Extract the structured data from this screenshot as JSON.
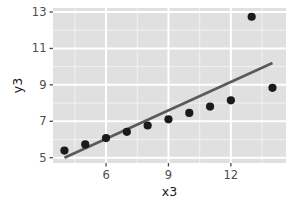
{
  "chart_data": {
    "type": "scatter",
    "title": "",
    "xlabel": "x3",
    "ylabel": "y3",
    "x": [
      4,
      5,
      6,
      7,
      8,
      9,
      10,
      11,
      12,
      13,
      14
    ],
    "y": [
      5.39,
      5.73,
      6.08,
      6.42,
      6.77,
      7.11,
      7.46,
      7.81,
      8.15,
      12.74,
      8.84
    ],
    "xlim": [
      3.45,
      14.65
    ],
    "ylim": [
      4.71,
      13.22
    ],
    "xticks": [
      6,
      9,
      12
    ],
    "xtick_labels": [
      "6",
      "9",
      "12"
    ],
    "yticks": [
      5,
      7,
      9,
      11,
      13
    ],
    "ytick_labels": [
      "5",
      "7",
      "9",
      "11",
      "13"
    ],
    "x_minor_ticks": [
      4.5,
      7.5,
      10.5,
      13.5
    ],
    "y_minor_ticks": [
      6,
      8,
      10,
      12
    ],
    "grid": true,
    "legend": "none",
    "series": [
      {
        "name": "points",
        "kind": "scatter",
        "marker": "filled-circle",
        "color": "#1a1a1a",
        "size": 4.1,
        "values": [
          5.39,
          5.73,
          6.08,
          6.42,
          6.77,
          7.11,
          7.46,
          7.81,
          8.15,
          12.74,
          8.84
        ]
      },
      {
        "name": "linear-fit",
        "kind": "line",
        "color": "#5a5a5a",
        "width": 2.6,
        "x_start": 4.0,
        "y_start": 5.0,
        "x_end": 14.0,
        "y_end": 10.2
      }
    ],
    "panel_background": "#e0e0e0",
    "major_gridline_color": "#ffffff",
    "minor_gridline_color": "#f2f2f2",
    "plot_background": "#ffffff",
    "tick_mark_color": "#4d4d4d",
    "tick_label_color": "#4d4d4d",
    "axis_title_color": "#1a1a1a"
  },
  "panel": {
    "left": 53,
    "right": 286,
    "top": 8,
    "bottom": 163
  }
}
